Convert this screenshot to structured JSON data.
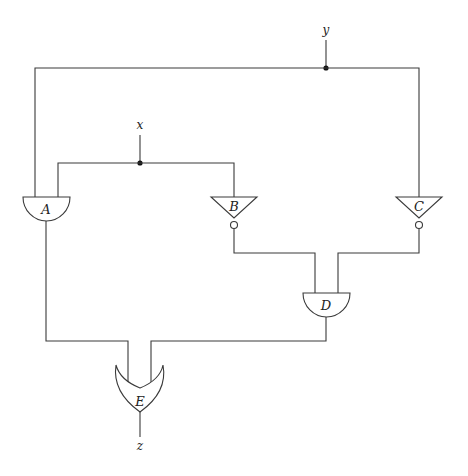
{
  "diagram": {
    "type": "logic-circuit",
    "inputs": [
      {
        "id": "x",
        "label": "x"
      },
      {
        "id": "y",
        "label": "y"
      }
    ],
    "outputs": [
      {
        "id": "z",
        "label": "z"
      }
    ],
    "gates": [
      {
        "id": "A",
        "label": "A",
        "kind": "AND",
        "inputs": [
          "y",
          "x"
        ]
      },
      {
        "id": "B",
        "label": "B",
        "kind": "NOT",
        "inputs": [
          "x"
        ]
      },
      {
        "id": "C",
        "label": "C",
        "kind": "NOT",
        "inputs": [
          "y"
        ]
      },
      {
        "id": "D",
        "label": "D",
        "kind": "AND",
        "inputs": [
          "B",
          "C"
        ]
      },
      {
        "id": "E",
        "label": "E",
        "kind": "OR",
        "inputs": [
          "A",
          "D"
        ],
        "output": "z"
      }
    ],
    "junctions": [
      "x",
      "y"
    ]
  },
  "colors": {
    "wire": "#3a3a3a",
    "junction": "#111111",
    "background": "#ffffff"
  }
}
